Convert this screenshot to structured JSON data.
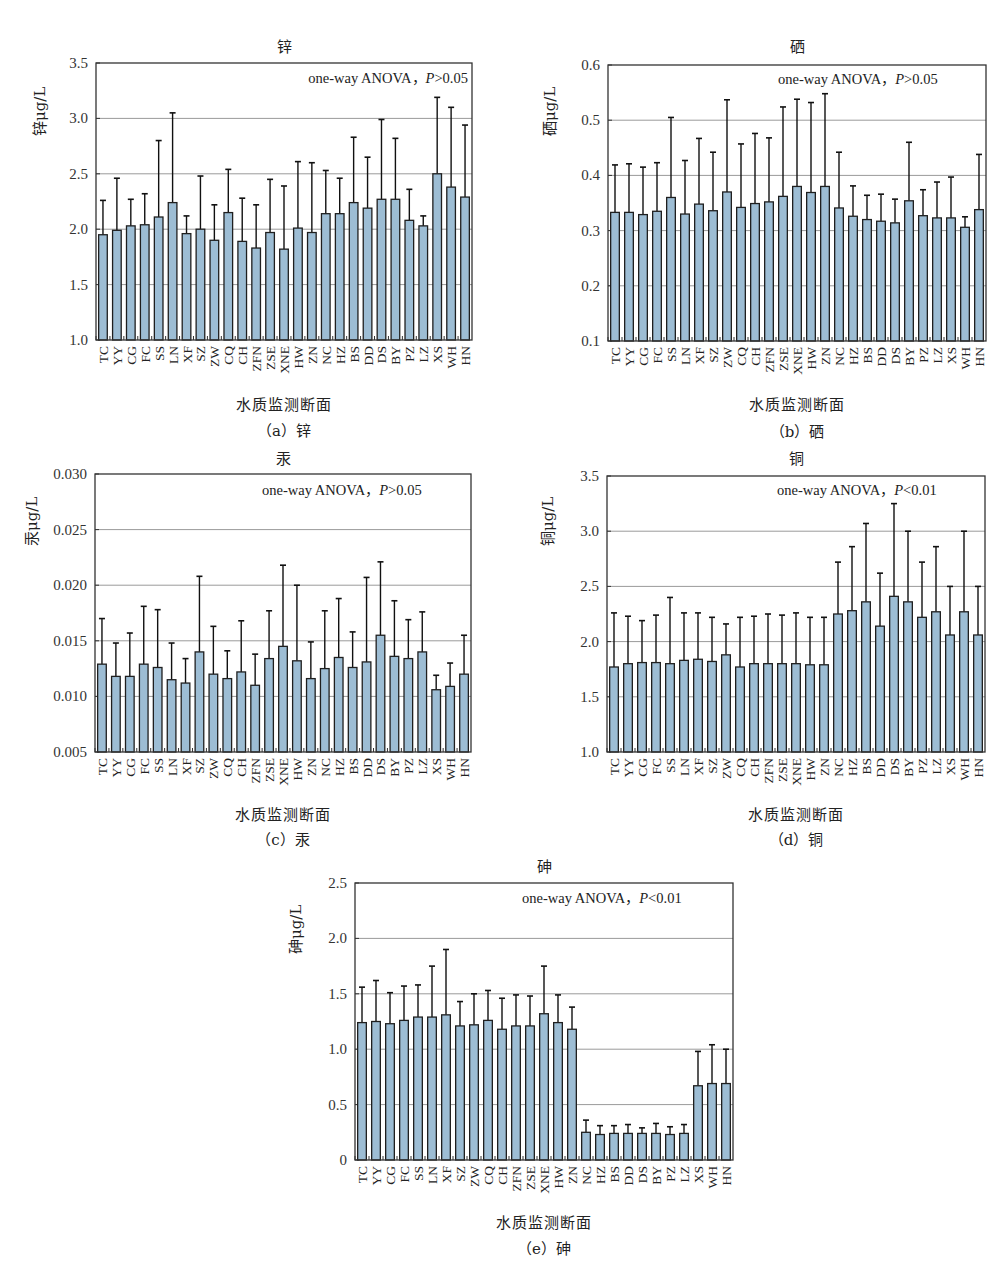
{
  "figure": {
    "x_axis_label": "水质监测断面"
  },
  "chart_data": [
    {
      "id": "a",
      "type": "bar",
      "title": "锌",
      "caption": "（a）锌",
      "xlabel": "水质监测断面",
      "ylabel": "锌μg/L",
      "annotation": "one-way ANOVA，",
      "annotation_p": "P",
      "annotation_tail": ">0.05",
      "ylim": [
        1.0,
        3.5
      ],
      "yticks": [
        1.0,
        1.5,
        2.0,
        2.5,
        3.0,
        3.5
      ],
      "ytick_labels": [
        "1.0",
        "1.5",
        "2.0",
        "2.5",
        "3.0",
        "3.5"
      ],
      "grid": true,
      "categories": [
        "TC",
        "YY",
        "CG",
        "FC",
        "SS",
        "LN",
        "XF",
        "SZ",
        "ZW",
        "CQ",
        "CH",
        "ZFN",
        "ZSE",
        "XNE",
        "HW",
        "ZN",
        "NC",
        "HZ",
        "BS",
        "DD",
        "DS",
        "BY",
        "PZ",
        "LZ",
        "XS",
        "WH",
        "HN"
      ],
      "values": [
        1.95,
        1.99,
        2.03,
        2.04,
        2.11,
        2.24,
        1.96,
        2.0,
        1.9,
        2.15,
        1.89,
        1.83,
        1.97,
        1.82,
        2.01,
        1.97,
        2.14,
        2.14,
        2.24,
        2.19,
        2.27,
        2.27,
        2.08,
        2.03,
        2.5,
        2.38,
        2.29
      ],
      "error_upper": [
        2.26,
        2.46,
        2.27,
        2.32,
        2.8,
        3.05,
        2.12,
        2.48,
        2.22,
        2.54,
        2.28,
        2.22,
        2.45,
        2.39,
        2.61,
        2.6,
        2.53,
        2.46,
        2.83,
        2.65,
        2.99,
        2.82,
        2.36,
        2.12,
        3.19,
        3.1,
        2.94
      ]
    },
    {
      "id": "b",
      "type": "bar",
      "title": "硒",
      "caption": "（b）硒",
      "xlabel": "水质监测断面",
      "ylabel": "硒μg/L",
      "annotation": "one-way ANOVA，",
      "annotation_p": "P",
      "annotation_tail": ">0.05",
      "ylim": [
        0.1,
        0.6
      ],
      "yticks": [
        0.1,
        0.2,
        0.3,
        0.4,
        0.5,
        0.6
      ],
      "ytick_labels": [
        "0.1",
        "0.2",
        "0.3",
        "0.4",
        "0.5",
        "0.6"
      ],
      "grid": true,
      "categories": [
        "TC",
        "YY",
        "CG",
        "FC",
        "SS",
        "LN",
        "XF",
        "SZ",
        "ZW",
        "CQ",
        "CH",
        "ZFN",
        "ZSE",
        "XNE",
        "HW",
        "ZN",
        "NC",
        "HZ",
        "BS",
        "DD",
        "DS",
        "BY",
        "PZ",
        "LZ",
        "XS",
        "WH",
        "HN"
      ],
      "values": [
        0.333,
        0.333,
        0.329,
        0.335,
        0.36,
        0.33,
        0.348,
        0.336,
        0.37,
        0.342,
        0.349,
        0.352,
        0.362,
        0.38,
        0.369,
        0.38,
        0.341,
        0.326,
        0.32,
        0.317,
        0.314,
        0.354,
        0.327,
        0.323,
        0.323,
        0.306,
        0.338
      ],
      "error_upper": [
        0.419,
        0.421,
        0.415,
        0.423,
        0.505,
        0.427,
        0.467,
        0.442,
        0.537,
        0.457,
        0.476,
        0.468,
        0.524,
        0.538,
        0.532,
        0.548,
        0.442,
        0.381,
        0.364,
        0.366,
        0.357,
        0.46,
        0.374,
        0.388,
        0.397,
        0.325,
        0.438
      ]
    },
    {
      "id": "c",
      "type": "bar",
      "title": "汞",
      "caption": "（c）汞",
      "xlabel": "水质监测断面",
      "ylabel": "汞μg/L",
      "annotation": "one-way ANOVA，",
      "annotation_p": "P",
      "annotation_tail": ">0.05",
      "ylim": [
        0.005,
        0.03
      ],
      "yticks": [
        0.005,
        0.01,
        0.015,
        0.02,
        0.025,
        0.03
      ],
      "ytick_labels": [
        "0.005",
        "0.010",
        "0.015",
        "0.020",
        "0.025",
        "0.030"
      ],
      "grid": true,
      "categories": [
        "TC",
        "YY",
        "CG",
        "FC",
        "SS",
        "LN",
        "XF",
        "SZ",
        "ZW",
        "CQ",
        "CH",
        "ZFN",
        "ZSE",
        "XNE",
        "HW",
        "ZN",
        "NC",
        "HZ",
        "BS",
        "DD",
        "DS",
        "BY",
        "PZ",
        "LZ",
        "XS",
        "WH",
        "HN"
      ],
      "values": [
        0.0129,
        0.0118,
        0.0118,
        0.0129,
        0.0126,
        0.0115,
        0.0112,
        0.014,
        0.012,
        0.0116,
        0.0122,
        0.011,
        0.0134,
        0.0145,
        0.0132,
        0.0116,
        0.0125,
        0.0135,
        0.0126,
        0.0131,
        0.0155,
        0.0136,
        0.0134,
        0.014,
        0.0106,
        0.0109,
        0.012
      ],
      "error_upper": [
        0.017,
        0.0148,
        0.0157,
        0.0181,
        0.0178,
        0.0148,
        0.0134,
        0.0208,
        0.0163,
        0.0141,
        0.0168,
        0.0138,
        0.0177,
        0.0218,
        0.02,
        0.0149,
        0.0177,
        0.0188,
        0.0158,
        0.0207,
        0.0221,
        0.0186,
        0.0169,
        0.0176,
        0.0119,
        0.013,
        0.0155
      ]
    },
    {
      "id": "d",
      "type": "bar",
      "title": "铜",
      "caption": "（d）铜",
      "xlabel": "水质监测断面",
      "ylabel": "铜μg/L",
      "annotation": "one-way ANOVA，",
      "annotation_p": "P",
      "annotation_tail": "<0.01",
      "ylim": [
        1.0,
        3.5
      ],
      "yticks": [
        1.0,
        1.5,
        2.0,
        2.5,
        3.0,
        3.5
      ],
      "ytick_labels": [
        "1.0",
        "1.5",
        "2.0",
        "2.5",
        "3.0",
        "3.5"
      ],
      "grid": true,
      "categories": [
        "TC",
        "YY",
        "CG",
        "FC",
        "SS",
        "LN",
        "XF",
        "SZ",
        "ZW",
        "CQ",
        "CH",
        "ZFN",
        "ZSE",
        "XNE",
        "HW",
        "ZN",
        "NC",
        "HZ",
        "BS",
        "DD",
        "DS",
        "BY",
        "PZ",
        "LZ",
        "XS",
        "WH",
        "HN"
      ],
      "values": [
        1.77,
        1.8,
        1.81,
        1.81,
        1.8,
        1.83,
        1.84,
        1.82,
        1.88,
        1.77,
        1.8,
        1.8,
        1.8,
        1.8,
        1.79,
        1.79,
        2.25,
        2.28,
        2.36,
        2.14,
        2.41,
        2.36,
        2.22,
        2.27,
        2.06,
        2.27,
        2.06
      ],
      "error_upper": [
        2.26,
        2.23,
        2.19,
        2.24,
        2.4,
        2.26,
        2.26,
        2.22,
        2.16,
        2.22,
        2.23,
        2.25,
        2.24,
        2.26,
        2.22,
        2.22,
        2.72,
        2.86,
        3.07,
        2.62,
        3.25,
        3.0,
        2.72,
        2.86,
        2.5,
        3.0,
        2.5
      ]
    },
    {
      "id": "e",
      "type": "bar",
      "title": "砷",
      "caption": "（e）砷",
      "xlabel": "水质监测断面",
      "ylabel": "砷μg/L",
      "annotation": "one-way ANOVA，",
      "annotation_p": "P",
      "annotation_tail": "<0.01",
      "ylim": [
        0,
        2.5
      ],
      "yticks": [
        0,
        0.5,
        1.0,
        1.5,
        2.0,
        2.5
      ],
      "ytick_labels": [
        "0",
        "0.5",
        "1.0",
        "1.5",
        "2.0",
        "2.5"
      ],
      "grid": true,
      "categories": [
        "TC",
        "YY",
        "CG",
        "FC",
        "SS",
        "LN",
        "XF",
        "SZ",
        "ZW",
        "CQ",
        "CH",
        "ZFN",
        "ZSE",
        "XNE",
        "HW",
        "ZN",
        "NC",
        "HZ",
        "BS",
        "DD",
        "DS",
        "BY",
        "PZ",
        "LZ",
        "XS",
        "WH",
        "HN"
      ],
      "values": [
        1.24,
        1.25,
        1.23,
        1.26,
        1.29,
        1.29,
        1.31,
        1.21,
        1.22,
        1.26,
        1.18,
        1.21,
        1.21,
        1.32,
        1.24,
        1.18,
        0.25,
        0.23,
        0.24,
        0.24,
        0.24,
        0.24,
        0.23,
        0.24,
        0.67,
        0.69,
        0.69
      ],
      "error_upper": [
        1.56,
        1.62,
        1.51,
        1.57,
        1.58,
        1.75,
        1.9,
        1.43,
        1.5,
        1.53,
        1.46,
        1.49,
        1.48,
        1.75,
        1.49,
        1.38,
        0.36,
        0.31,
        0.31,
        0.32,
        0.29,
        0.33,
        0.3,
        0.32,
        0.98,
        1.04,
        1.0
      ]
    }
  ],
  "colors": {
    "bar_fill": "#9dbdd4",
    "bar_stroke": "#1f1f1f",
    "grid": "#9a9a9a",
    "axis": "#333333"
  }
}
